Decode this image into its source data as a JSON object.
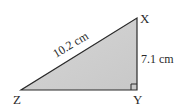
{
  "diagram": {
    "type": "right-triangle",
    "fill_color": "#cfcfcf",
    "stroke_color": "#2a2a2a",
    "vertices": {
      "X": {
        "label": "X"
      },
      "Y": {
        "label": "Y"
      },
      "Z": {
        "label": "Z"
      }
    },
    "sides": {
      "hypotenuse_ZX": {
        "label": "10.2 cm"
      },
      "side_XY": {
        "label": "7.1 cm"
      }
    },
    "right_angle_at": "Y"
  }
}
